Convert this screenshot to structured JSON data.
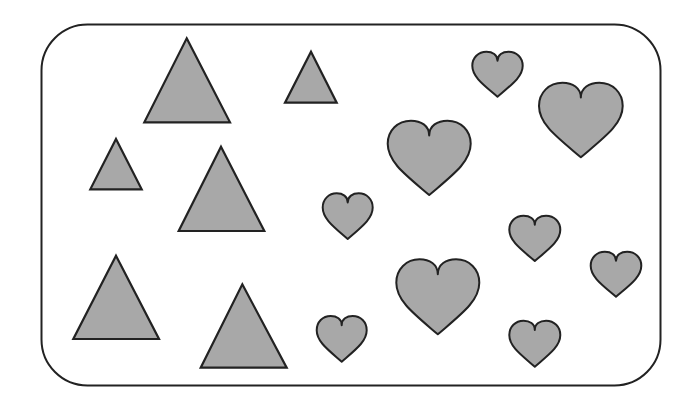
{
  "scene": {
    "width": 694,
    "height": 403,
    "background": "#ffffff",
    "frame": {
      "x": 41.5,
      "y": 24.5,
      "width": 619,
      "height": 361,
      "radius": 46,
      "stroke": "#222222",
      "stroke_width": 2
    },
    "fill_color": "#a8a8a8",
    "stroke_color": "#222222",
    "counts": {
      "triangles": 6,
      "hearts": 9
    },
    "triangles": [
      {
        "apex": [
          186.7,
          38.3
        ],
        "base_left": [
          144.3,
          122.3
        ],
        "base_right": [
          230,
          122.3
        ]
      },
      {
        "apex": [
          311,
          51.7
        ],
        "base_left": [
          285,
          102.7
        ],
        "base_right": [
          336.7,
          102.7
        ]
      },
      {
        "apex": [
          116,
          139
        ],
        "base_left": [
          90.3,
          189.3
        ],
        "base_right": [
          141.7,
          189.3
        ]
      },
      {
        "apex": [
          221,
          146.7
        ],
        "base_left": [
          178.7,
          231
        ],
        "base_right": [
          264.3,
          231
        ]
      },
      {
        "apex": [
          116,
          255.7
        ],
        "base_left": [
          73.3,
          339
        ],
        "base_right": [
          159,
          339
        ]
      },
      {
        "apex": [
          242.3,
          284.3
        ],
        "base_left": [
          200.7,
          367.7
        ],
        "base_right": [
          286.7,
          367.7
        ]
      }
    ],
    "hearts": [
      {
        "x": 472.3,
        "y": 51.7,
        "w": 50.4,
        "h": 45
      },
      {
        "x": 539,
        "y": 82.7,
        "w": 83.7,
        "h": 74.6
      },
      {
        "x": 387.7,
        "y": 120.7,
        "w": 83,
        "h": 74.3
      },
      {
        "x": 322.7,
        "y": 193.3,
        "w": 50,
        "h": 45.7
      },
      {
        "x": 509.3,
        "y": 215.7,
        "w": 51,
        "h": 45.3
      },
      {
        "x": 590.7,
        "y": 251.7,
        "w": 50.6,
        "h": 45
      },
      {
        "x": 396.3,
        "y": 259.3,
        "w": 83,
        "h": 75
      },
      {
        "x": 316.7,
        "y": 316,
        "w": 50,
        "h": 45.7
      },
      {
        "x": 509.3,
        "y": 320.7,
        "w": 51,
        "h": 46
      }
    ]
  }
}
